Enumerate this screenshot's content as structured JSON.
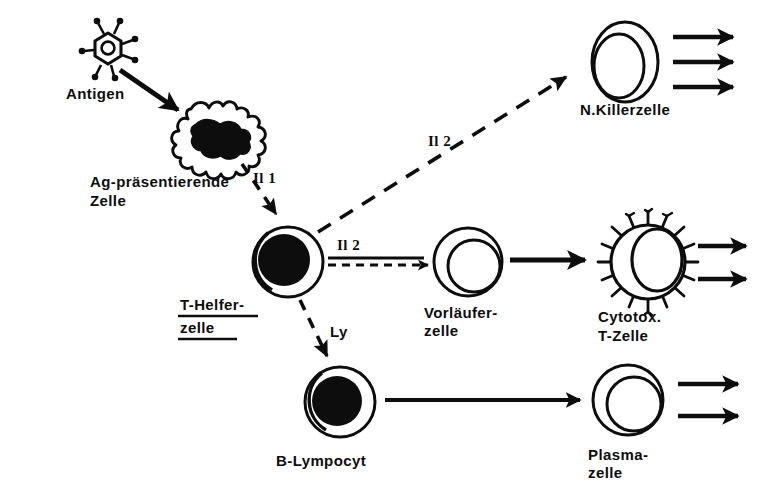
{
  "figure": {
    "language": "de",
    "background_color": "#ffffff",
    "ink_color": "#0d0d0d"
  },
  "nodes": {
    "antigen": {
      "label": "Antigen",
      "icon": "virus-particle-icon",
      "x": 108,
      "y": 48
    },
    "apc": {
      "label_line1": "Ag-präsentierende",
      "label_line2": "Zelle",
      "icon": "amoeboid-cell-icon",
      "x": 212,
      "y": 140
    },
    "t_helper": {
      "label_line1": "T-Helfer-",
      "label_line2": "zelle",
      "icon": "cell-dark-nucleus-icon",
      "underlined": true,
      "x": 288,
      "y": 262
    },
    "nk_cell": {
      "label": "N.Killerzelle",
      "icon": "cell-light-nucleus-icon",
      "x": 625,
      "y": 62,
      "output_arrows": 3
    },
    "precursor": {
      "label_line1": "Vorläufer-",
      "label_line2": "zelle",
      "icon": "cell-light-nucleus-icon",
      "x": 468,
      "y": 262,
      "output_arrows": 0
    },
    "cytotox_t": {
      "label_line1": "Cytotox.",
      "label_line2": "T-Zelle",
      "icon": "spiked-cell-icon",
      "x": 648,
      "y": 262,
      "output_arrows": 2
    },
    "b_lymphocyte": {
      "label": "B-Lympocyt",
      "icon": "cell-dark-nucleus-icon",
      "x": 340,
      "y": 402,
      "output_arrows": 0
    },
    "plasma_cell": {
      "label_line1": "Plasma-",
      "label_line2": "zelle",
      "icon": "cell-light-nucleus-icon",
      "x": 628,
      "y": 402,
      "output_arrows": 2
    }
  },
  "edges": {
    "antigen_to_apc": {
      "label": "",
      "style": "solid",
      "from": "antigen",
      "to": "apc"
    },
    "apc_to_thelper": {
      "label": "Il 1",
      "style": "dashed",
      "from": "apc",
      "to": "t_helper"
    },
    "thelper_to_nk": {
      "label": "Il 2",
      "style": "dashed",
      "from": "t_helper",
      "to": "nk_cell"
    },
    "thelper_to_precursor": {
      "label": "Il 2",
      "style": "double-dashed",
      "from": "t_helper",
      "to": "precursor"
    },
    "thelper_to_blymph": {
      "label": "Ly",
      "style": "dashed",
      "from": "t_helper",
      "to": "b_lymphocyte"
    },
    "precursor_to_cytotox": {
      "label": "",
      "style": "solid",
      "from": "precursor",
      "to": "cytotox_t"
    },
    "blymph_to_plasma": {
      "label": "",
      "style": "solid",
      "from": "b_lymphocyte",
      "to": "plasma_cell"
    }
  }
}
